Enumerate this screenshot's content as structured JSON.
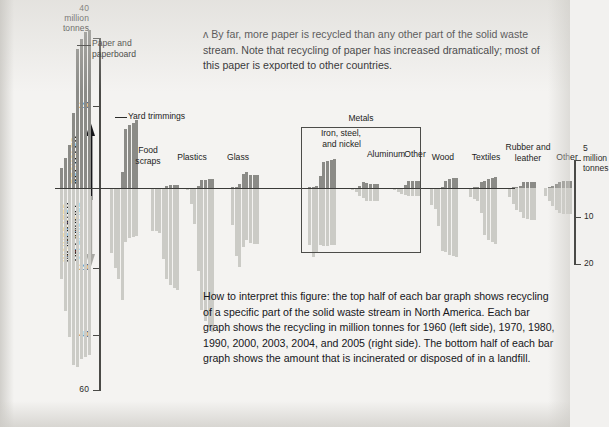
{
  "figure": {
    "units_left": "million tonnes",
    "arrow_up_label": "RECYCLED",
    "arrow_down_label": "INCINERATED\nOR LANDFILL",
    "metals_group_label": "Metals",
    "left_axis_top_value": "40",
    "left_axis_unit_line1": "million",
    "left_axis_unit_line2": "tonnes",
    "right_axis_top_value": "5",
    "right_axis_unit_line1": "million",
    "right_axis_unit_line2": "tonnes"
  },
  "captions": {
    "top": "ʌ By far, more paper is recycled than any other part of the solid waste stream. Note that recycling of paper has increased dramatically; most of this paper is exported to other countries.",
    "bottom": "How to interpret this figure: the top half of each bar graph shows recycling of a specific part of the solid waste stream in North America. Each bar graph shows the recycling in million tonnes for 1960 (left side), 1970, 1980, 1990, 2000, 2003, 2004, and 2005 (right side). The bottom half of each bar graph shows the amount that is incinerated or disposed of in a landfill."
  },
  "axes": {
    "left_ticks": [
      "40",
      "20",
      "20",
      "40",
      "60"
    ],
    "right_ticks": [
      "5",
      "10",
      "20"
    ]
  },
  "chart_data": {
    "type": "bar",
    "xlabel": "",
    "ylabel": "million tonnes",
    "ylim": [
      -60,
      40
    ],
    "grid": false,
    "legend_position": "none",
    "years": [
      "1960",
      "1970",
      "1980",
      "1990",
      "2000",
      "2003",
      "2004",
      "2005"
    ],
    "note_scales": "Left-hand groups (Paper, Yard trimmings, Food scraps) use the left axis: 40/20 recycled above the zero line, 20/40/60 incinerated-or-landfill below. Right-hand groups use the expanded right axis: 5 above, 10/20 below.",
    "groups": [
      {
        "name": "Paper and paperboard",
        "axis": "left",
        "recycled": [
          5.4,
          8.0,
          11.5,
          20.2,
          37.5,
          40.0,
          42.0,
          42.4
        ],
        "landfilled": [
          24.5,
          33.0,
          40.0,
          47.5,
          48.0,
          46.0,
          45.5,
          45.0
        ]
      },
      {
        "name": "Yard trimmings",
        "axis": "left",
        "recycled": [
          0.0,
          0.0,
          0.0,
          4.2,
          15.8,
          17.0,
          17.6,
          18.2
        ],
        "landfilled": [
          17.5,
          21.5,
          24.5,
          30.0,
          14.5,
          13.5,
          13.2,
          13.0
        ]
      },
      {
        "name": "Food scraps",
        "axis": "left",
        "recycled": [
          0.0,
          0.0,
          0.0,
          0.0,
          0.6,
          0.7,
          0.7,
          0.7
        ],
        "landfilled": [
          11.5,
          11.5,
          12.0,
          19.0,
          24.5,
          26.0,
          27.0,
          27.5
        ]
      },
      {
        "name": "Plastics",
        "axis": "right",
        "recycled": [
          0.0,
          0.0,
          0.02,
          0.35,
          1.4,
          1.5,
          1.6,
          1.7
        ],
        "landfilled": [
          0.4,
          2.8,
          6.5,
          15.0,
          22.0,
          24.0,
          25.0,
          26.0
        ]
      },
      {
        "name": "Glass",
        "axis": "right",
        "recycled": [
          0.1,
          0.15,
          0.7,
          2.6,
          2.8,
          2.4,
          2.4,
          2.4
        ],
        "landfilled": [
          6.6,
          12.3,
          14.3,
          10.6,
          9.4,
          9.9,
          10.0,
          10.1
        ]
      },
      {
        "name": "Iron, steel, and nickel",
        "axis": "right",
        "group": "Metals",
        "recycled": [
          0.1,
          0.15,
          0.4,
          2.2,
          4.7,
          4.8,
          5.1,
          5.3
        ],
        "landfilled": [
          10.2,
          12.5,
          11.6,
          10.2,
          10.5,
          10.4,
          10.3,
          10.2
        ]
      },
      {
        "name": "Aluminum",
        "axis": "right",
        "group": "Metals",
        "recycled": [
          0.0,
          0.01,
          0.31,
          1.01,
          0.86,
          0.69,
          0.69,
          0.69
        ],
        "landfilled": [
          0.4,
          0.8,
          1.4,
          1.8,
          2.3,
          2.4,
          2.4,
          2.4
        ]
      },
      {
        "name": "Other",
        "axis": "right",
        "group": "Metals",
        "recycled": [
          0.0,
          0.0,
          0.05,
          0.6,
          1.2,
          1.3,
          1.3,
          1.3
        ],
        "landfilled": [
          0.4,
          0.7,
          1.0,
          1.2,
          1.5,
          1.5,
          1.5,
          1.5
        ]
      },
      {
        "name": "Wood",
        "axis": "right",
        "recycled": [
          0.0,
          0.0,
          0.0,
          0.1,
          1.3,
          1.6,
          1.8,
          1.8
        ],
        "landfilled": [
          3.0,
          3.7,
          6.9,
          11.3,
          11.6,
          12.0,
          12.2,
          12.4
        ]
      },
      {
        "name": "Textiles",
        "axis": "right",
        "recycled": [
          0.05,
          0.1,
          0.25,
          1.1,
          1.3,
          1.7,
          1.8,
          1.9
        ],
        "landfilled": [
          1.7,
          2.0,
          2.4,
          4.5,
          8.5,
          9.3,
          9.8,
          10.0
        ]
      },
      {
        "name": "Rubber and leather",
        "axis": "right",
        "recycled": [
          0.0,
          0.1,
          0.15,
          0.4,
          1.0,
          1.1,
          1.1,
          1.1
        ],
        "landfilled": [
          1.6,
          2.8,
          3.9,
          4.4,
          5.4,
          5.6,
          5.7,
          5.8
        ]
      },
      {
        "name": "Other",
        "axis": "right",
        "recycled": [
          0.0,
          0.2,
          0.4,
          0.7,
          1.1,
          1.2,
          1.3,
          1.3
        ],
        "landfilled": [
          1.5,
          2.3,
          3.2,
          3.9,
          4.5,
          4.6,
          4.6,
          4.7
        ]
      }
    ]
  },
  "colors": {
    "recycled_bar": "#8b8b87",
    "landfill_bar": "#cbcbc6",
    "axis": "#4a4a47",
    "page_background": "#f4f3f1",
    "text": "#16161a"
  }
}
